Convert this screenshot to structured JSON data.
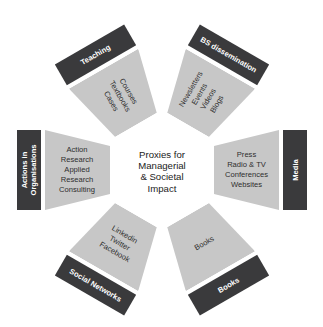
{
  "center": {
    "lines": [
      "Proxies for",
      "Managerial",
      "& Societal",
      "Impact"
    ]
  },
  "colors": {
    "dark_band": "#3a3a3c",
    "light_block": "#c7c7c7",
    "background": "#ffffff"
  },
  "sectors": [
    {
      "label": "Media",
      "items": [
        "Press",
        "Radio & TV",
        "Conferences",
        "Websites"
      ]
    },
    {
      "label": "Books",
      "items": [
        "Books"
      ]
    },
    {
      "label": "Social Networks",
      "items": [
        "Linkedin",
        "Twitter",
        "Facebook"
      ]
    },
    {
      "label_lines": [
        "Actions in",
        "Organisations"
      ],
      "items": [
        "Action",
        "Research",
        "Applied",
        "Research",
        "Consulting"
      ]
    },
    {
      "label": "Teaching",
      "items": [
        "Courses",
        "Textbooks",
        "Cases"
      ]
    },
    {
      "label": "BS dissemination",
      "items": [
        "Newsletters",
        "Events",
        "Videos",
        "Blogs"
      ]
    }
  ]
}
